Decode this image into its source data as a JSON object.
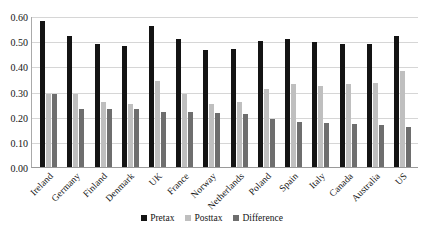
{
  "chart_data": {
    "type": "bar",
    "title": "",
    "xlabel": "",
    "ylabel": "",
    "ylim": [
      0.0,
      0.6
    ],
    "yticks": [
      "0.00",
      "0.10",
      "0.20",
      "0.30",
      "0.40",
      "0.50",
      "0.60"
    ],
    "grid": true,
    "legend_position": "bottom",
    "categories": [
      "Ireland",
      "Germany",
      "Finland",
      "Denmark",
      "UK",
      "France",
      "Norway",
      "Netherlands",
      "Poland",
      "Spain",
      "Italy",
      "Canada",
      "Australia",
      "US"
    ],
    "series": [
      {
        "name": "Pretax",
        "color": "#141414",
        "values": [
          0.58,
          0.52,
          0.49,
          0.48,
          0.56,
          0.51,
          0.465,
          0.47,
          0.5,
          0.51,
          0.495,
          0.49,
          0.49,
          0.52
        ]
      },
      {
        "name": "Posttax",
        "color": "#bfbfbf",
        "values": [
          0.29,
          0.29,
          0.26,
          0.25,
          0.34,
          0.29,
          0.25,
          0.26,
          0.31,
          0.33,
          0.32,
          0.33,
          0.335,
          0.38
        ]
      },
      {
        "name": "Difference",
        "color": "#6e6e6e",
        "values": [
          0.29,
          0.23,
          0.23,
          0.23,
          0.22,
          0.22,
          0.215,
          0.21,
          0.19,
          0.18,
          0.175,
          0.17,
          0.165,
          0.16
        ]
      }
    ]
  }
}
